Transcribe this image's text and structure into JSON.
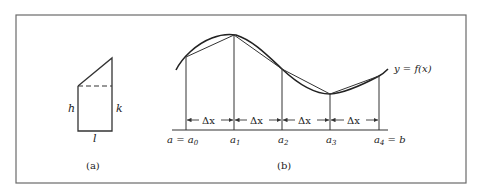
{
  "figure": {
    "panel_a": {
      "caption": "(a)",
      "labels": {
        "left": "h",
        "right": "k",
        "bottom": "l"
      }
    },
    "panel_b": {
      "caption": "(b)",
      "curve_label": "y = f(x)",
      "interval_label": "Δx",
      "x_labels": [
        {
          "text": "a = a",
          "sub": "0"
        },
        {
          "text": "a",
          "sub": "1"
        },
        {
          "text": "a",
          "sub": "2"
        },
        {
          "text": "a",
          "sub": "3"
        },
        {
          "text": "a",
          "sub": "4",
          "suffix": " = b"
        }
      ]
    }
  },
  "colors": {
    "line": "#333333",
    "frame": "#666666",
    "background": "#ffffff"
  }
}
